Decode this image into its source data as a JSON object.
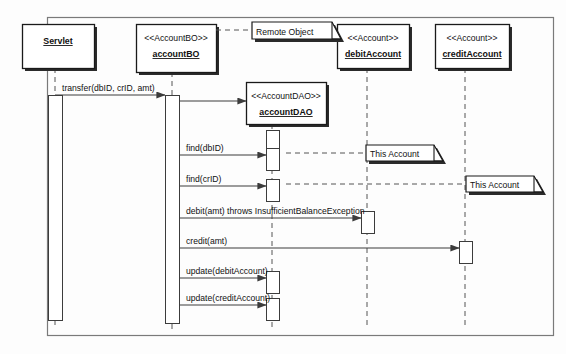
{
  "diagram": {
    "type": "uml-sequence-diagram",
    "title": "",
    "frame": {
      "x": 47,
      "y": 17,
      "width": 506,
      "height": 318
    },
    "colors": {
      "line": "#3c3c3c",
      "box_fill": "#ffffff",
      "box_stroke": "#1a1a1a",
      "shadow": "#2b2b2b",
      "text": "#111111",
      "lifeline": "#555555",
      "background": "#fdfdfd"
    }
  },
  "participants": [
    {
      "id": "servlet",
      "stereotype": "",
      "name": "Servlet",
      "box": {
        "x": 22,
        "y": 24,
        "width": 72,
        "height": 44
      },
      "lifeline_x": 55,
      "activation": {
        "x": 48,
        "y": 95,
        "width": 14,
        "height": 225
      }
    },
    {
      "id": "accountBO",
      "stereotype": "<<AccountBO>>",
      "name": "accountBO",
      "box": {
        "x": 136,
        "y": 24,
        "width": 80,
        "height": 48
      },
      "lifeline_x": 172,
      "activation": {
        "x": 165,
        "y": 95,
        "width": 14,
        "height": 228
      }
    },
    {
      "id": "accountDAO",
      "stereotype": "<<AccountDAO>>",
      "name": "accountDAO",
      "box": {
        "x": 246,
        "y": 82,
        "width": 80,
        "height": 42
      },
      "lifeline_x": 272,
      "activation": null
    },
    {
      "id": "debitAccount",
      "stereotype": "<<Account>>",
      "name": "debitAccount",
      "box": {
        "x": 337,
        "y": 24,
        "width": 72,
        "height": 44
      },
      "lifeline_x": 367,
      "activation": null
    },
    {
      "id": "creditAccount",
      "stereotype": "<<Account>>",
      "name": "creditAccount",
      "box": {
        "x": 435,
        "y": 24,
        "width": 74,
        "height": 44
      },
      "lifeline_x": 465,
      "activation": null
    }
  ],
  "notes": [
    {
      "id": "note-remote-object",
      "label": "Remote Object",
      "box": {
        "x": 252,
        "y": 22,
        "width": 80,
        "height": 17
      },
      "anchor_from": {
        "x": 216,
        "y": 30
      },
      "anchor_to": {
        "x": 252,
        "y": 30
      }
    },
    {
      "id": "note-this-account-debit",
      "label": "This Account",
      "box": {
        "x": 366,
        "y": 145,
        "width": 68,
        "height": 16
      },
      "anchor_from": {
        "x": 286,
        "y": 153
      },
      "anchor_to": {
        "x": 366,
        "y": 153
      }
    },
    {
      "id": "note-this-account-credit",
      "label": "This Account",
      "box": {
        "x": 466,
        "y": 176,
        "width": 68,
        "height": 16
      },
      "anchor_from": {
        "x": 286,
        "y": 184
      },
      "anchor_to": {
        "x": 466,
        "y": 184
      }
    }
  ],
  "messages": [
    {
      "id": "msg-transfer",
      "label": "transfer(dbID, crID, amt)",
      "from_x": 55,
      "to_x": 165,
      "y": 95,
      "label_x": 62,
      "label_y": 91,
      "kind": "synchronous"
    },
    {
      "id": "msg-create-dao",
      "label": "",
      "from_x": 179,
      "to_x": 246,
      "y": 101,
      "label_x": 0,
      "label_y": 0,
      "kind": "synchronous"
    },
    {
      "id": "msg-find-dbid",
      "label": "find(dbID)",
      "from_x": 179,
      "to_x": 266,
      "y": 155,
      "label_x": 186,
      "label_y": 151,
      "kind": "synchronous"
    },
    {
      "id": "msg-find-crid",
      "label": "find(crID)",
      "from_x": 179,
      "to_x": 266,
      "y": 186,
      "label_x": 186,
      "label_y": 182,
      "kind": "synchronous"
    },
    {
      "id": "msg-debit",
      "label": "debit(amt) throws InsufficientBalanceException",
      "from_x": 179,
      "to_x": 361,
      "y": 218,
      "label_x": 186,
      "label_y": 214,
      "kind": "synchronous"
    },
    {
      "id": "msg-credit",
      "label": "credit(amt)",
      "from_x": 179,
      "to_x": 459,
      "y": 248,
      "label_x": 186,
      "label_y": 244,
      "kind": "synchronous"
    },
    {
      "id": "msg-update-debit",
      "label": "update(debitAccount)",
      "from_x": 179,
      "to_x": 266,
      "y": 278,
      "label_x": 186,
      "label_y": 274,
      "kind": "synchronous"
    },
    {
      "id": "msg-update-credit",
      "label": "update(creditAccount)",
      "from_x": 179,
      "to_x": 266,
      "y": 305,
      "label_x": 186,
      "label_y": 301,
      "kind": "synchronous"
    }
  ],
  "activation_boxes": [
    {
      "id": "act-dao-create",
      "x": 266,
      "y": 130,
      "width": 13,
      "height": 18
    },
    {
      "id": "act-dao-find-dbid",
      "x": 266,
      "y": 148,
      "width": 13,
      "height": 22
    },
    {
      "id": "act-dao-find-crid",
      "x": 266,
      "y": 179,
      "width": 13,
      "height": 22
    },
    {
      "id": "act-debit",
      "x": 361,
      "y": 211,
      "width": 13,
      "height": 22
    },
    {
      "id": "act-credit",
      "x": 459,
      "y": 241,
      "width": 13,
      "height": 22
    },
    {
      "id": "act-dao-update-debit",
      "x": 266,
      "y": 271,
      "width": 13,
      "height": 22
    },
    {
      "id": "act-dao-update-credit",
      "x": 266,
      "y": 298,
      "width": 13,
      "height": 22
    }
  ]
}
